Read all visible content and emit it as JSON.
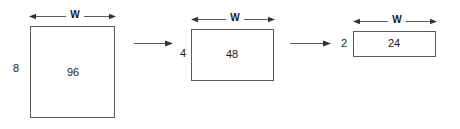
{
  "diagram": {
    "title": "",
    "line_color": "#5a5a5a",
    "text_color": "#1a1a1a",
    "background": "#ffffff",
    "width_label": "W",
    "steps": [
      {
        "id": "step-1",
        "area_label": "96",
        "height_label": "8",
        "width_label": "W"
      },
      {
        "id": "step-2",
        "area_label": "48",
        "height_label": "4",
        "width_label": "W"
      },
      {
        "id": "step-3",
        "area_label": "24",
        "height_label": "2",
        "width_label": "W"
      }
    ],
    "transitions": [
      {
        "id": "transition-1",
        "label": ""
      },
      {
        "id": "transition-2",
        "label": ""
      }
    ]
  }
}
